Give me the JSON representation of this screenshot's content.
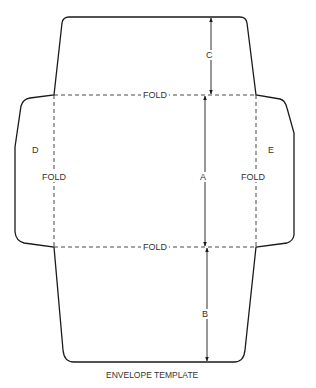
{
  "title": "ENVELOPE TEMPLATE",
  "fold_labels": {
    "top": "FOLD",
    "bottom": "FOLD",
    "left": "FOLD",
    "right": "FOLD"
  },
  "dimension_labels": {
    "a": "A",
    "b": "B",
    "c": "C"
  },
  "flap_labels": {
    "left": "D",
    "right": "E"
  },
  "colors": {
    "outline": "#1a1a1a",
    "fold_line": "#333333",
    "text": "#333333"
  }
}
